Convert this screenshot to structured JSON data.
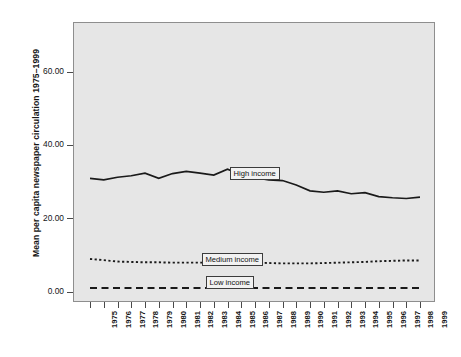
{
  "chart_data": {
    "type": "line",
    "title": "",
    "xlabel": "",
    "ylabel": "Mean per capita newspaper circulation 1975–1999",
    "ylim": [
      -4,
      72
    ],
    "yticks": [
      0,
      20,
      40,
      60
    ],
    "ytick_labels": [
      "0.00",
      "20.00",
      "40.00",
      "60.00"
    ],
    "grid": false,
    "legend_position": "inline-on-series",
    "categories": [
      "1975",
      "1976",
      "1977",
      "1978",
      "1979",
      "1980",
      "1981",
      "1982",
      "1983",
      "1984",
      "1985",
      "1986",
      "1987",
      "1988",
      "1989",
      "1990",
      "1991",
      "1992",
      "1993",
      "1994",
      "1995",
      "1996",
      "1997",
      "1998",
      "1999"
    ],
    "series": [
      {
        "name": "High income",
        "style": "solid",
        "label": "High income",
        "values": [
          31.0,
          30.6,
          31.3,
          31.7,
          32.4,
          31.0,
          32.3,
          32.9,
          32.4,
          31.9,
          33.5,
          32.0,
          31.2,
          30.6,
          30.4,
          29.2,
          27.6,
          27.2,
          27.6,
          26.8,
          27.1,
          26.0,
          25.7,
          25.5,
          25.9
        ]
      },
      {
        "name": "Medium income",
        "style": "dotted",
        "label": "Medium income",
        "values": [
          9.0,
          8.7,
          8.3,
          8.2,
          8.1,
          8.1,
          8.0,
          8.0,
          8.0,
          8.0,
          8.0,
          8.0,
          8.0,
          7.9,
          7.8,
          7.8,
          7.8,
          7.9,
          8.0,
          8.1,
          8.2,
          8.4,
          8.5,
          8.6,
          8.6
        ]
      },
      {
        "name": "Low income",
        "style": "dashed",
        "label": "Low income",
        "values": [
          1.1,
          1.1,
          1.1,
          1.1,
          1.1,
          1.1,
          1.1,
          1.1,
          1.1,
          1.1,
          1.1,
          1.1,
          1.1,
          1.1,
          1.1,
          1.1,
          1.1,
          1.1,
          1.1,
          1.1,
          1.1,
          1.1,
          1.1,
          1.1,
          1.1
        ]
      }
    ],
    "colors": {
      "plot_background": "#e6e6e6",
      "page_background": "#ffffff",
      "line": "#1a1a1a",
      "axis": "#8e8e8e",
      "label_box_fill": "#f2f2f2",
      "label_box_border": "#3c3c3c"
    },
    "series_label_anchors": [
      {
        "name": "High income",
        "category": "1985"
      },
      {
        "name": "Medium income",
        "category": "1985"
      },
      {
        "name": "Low income",
        "category": "1985"
      }
    ]
  }
}
